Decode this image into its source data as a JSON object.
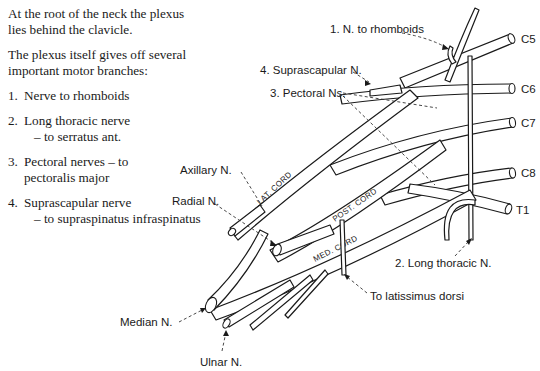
{
  "text": {
    "intro": "At the root of the neck the plexus lies behind the clavicle.",
    "lead": "The plexus itself gives off several important motor branches:",
    "items": [
      {
        "num": "1.",
        "main": "Nerve to rhomboids",
        "sub": ""
      },
      {
        "num": "2.",
        "main": "Long thoracic nerve",
        "sub": "– to serratus ant."
      },
      {
        "num": "3.",
        "main": "Pectoral nerves – to",
        "sub": "pectoralis major"
      },
      {
        "num": "4.",
        "main": "Suprascapular nerve",
        "sub": "– to supraspinatus infraspinatus"
      }
    ]
  },
  "diagram": {
    "roots": [
      "C5",
      "C6",
      "C7",
      "C8",
      "T1"
    ],
    "cords": {
      "lateral": "LAT. CORD",
      "posterior": "POST. CORD",
      "medial": "MED. CORD"
    },
    "labels": {
      "rhomboids": "1.  N. to rhomboids",
      "suprascapular": "4. Suprascapular N.",
      "pectoral": "3.  Pectoral Ns.",
      "axillary": "Axillary N.",
      "radial": "Radial N.",
      "long_thoracic": "2.  Long thoracic N.",
      "latissimus": "To latissimus dorsi",
      "median": "Median N.",
      "ulnar": "Ulnar N."
    }
  }
}
